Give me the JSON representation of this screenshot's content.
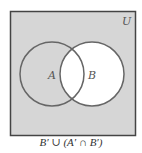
{
  "diagram": {
    "type": "venn",
    "universe_label": "U",
    "sets": [
      {
        "label": "A",
        "shaded": "outside B"
      },
      {
        "label": "B",
        "shaded": false
      }
    ],
    "shaded_region": "B'",
    "caption": "B′ ∪ (A′ ∩ B′)",
    "colors": {
      "shade": "#d6d6d6",
      "unshaded": "#ffffff",
      "stroke": "#555555"
    }
  }
}
